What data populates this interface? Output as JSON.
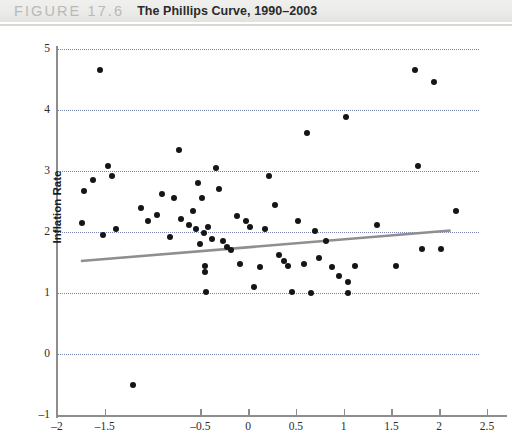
{
  "header": {
    "figure_label": "FIGURE 17.6",
    "figure_title": "The Phillips Curve, 1990–2003"
  },
  "chart_data": {
    "type": "scatter",
    "title": "The Phillips Curve, 1990–2003",
    "xlabel": "Percentage Deviation from Trend in GDP",
    "ylabel": "Inflation Rate",
    "xlim": [
      -2,
      2.5
    ],
    "ylim": [
      -1,
      5
    ],
    "grid": true,
    "legend": "none",
    "xticks": [
      -2,
      -1.5,
      -0.5,
      0,
      0.5,
      1,
      1.5,
      2,
      2.5
    ],
    "xtick_labels": [
      "–2",
      "–1.5",
      "–0.5",
      "0",
      "0.5",
      "1",
      "1.5",
      "2",
      "2.5"
    ],
    "yticks": [
      -1,
      0,
      1,
      2,
      3,
      4,
      5
    ],
    "ytick_labels": [
      "–1",
      "0",
      "1",
      "2",
      "3",
      "4",
      "5"
    ],
    "gridlines_y": [
      0,
      1,
      2,
      3,
      4,
      5
    ],
    "points": [
      [
        -1.74,
        2.15
      ],
      [
        -1.72,
        2.68
      ],
      [
        -1.62,
        2.86
      ],
      [
        -1.55,
        4.65
      ],
      [
        -1.52,
        1.95
      ],
      [
        -1.47,
        3.08
      ],
      [
        -1.42,
        2.92
      ],
      [
        -1.38,
        2.05
      ],
      [
        -1.2,
        -0.5
      ],
      [
        -1.12,
        2.4
      ],
      [
        -1.05,
        2.18
      ],
      [
        -0.95,
        2.28
      ],
      [
        -0.9,
        2.62
      ],
      [
        -0.82,
        1.92
      ],
      [
        -0.78,
        2.55
      ],
      [
        -0.72,
        3.35
      ],
      [
        -0.7,
        2.22
      ],
      [
        -0.62,
        2.12
      ],
      [
        -0.58,
        2.35
      ],
      [
        -0.55,
        2.05
      ],
      [
        -0.52,
        2.8
      ],
      [
        -0.5,
        1.8
      ],
      [
        -0.48,
        2.55
      ],
      [
        -0.46,
        1.98
      ],
      [
        -0.45,
        1.45
      ],
      [
        -0.45,
        1.35
      ],
      [
        -0.44,
        1.02
      ],
      [
        -0.42,
        2.08
      ],
      [
        -0.38,
        1.88
      ],
      [
        -0.34,
        3.05
      ],
      [
        -0.3,
        2.7
      ],
      [
        -0.26,
        1.85
      ],
      [
        -0.22,
        1.75
      ],
      [
        -0.18,
        1.7
      ],
      [
        -0.12,
        2.26
      ],
      [
        -0.08,
        1.48
      ],
      [
        -0.02,
        2.18
      ],
      [
        0.02,
        2.08
      ],
      [
        0.06,
        1.1
      ],
      [
        0.12,
        1.42
      ],
      [
        0.18,
        2.05
      ],
      [
        0.22,
        2.92
      ],
      [
        0.28,
        2.45
      ],
      [
        0.32,
        1.62
      ],
      [
        0.38,
        1.52
      ],
      [
        0.42,
        1.45
      ],
      [
        0.46,
        1.02
      ],
      [
        0.52,
        2.18
      ],
      [
        0.58,
        1.48
      ],
      [
        0.62,
        3.62
      ],
      [
        0.66,
        1.0
      ],
      [
        0.7,
        2.02
      ],
      [
        0.74,
        1.58
      ],
      [
        0.82,
        1.85
      ],
      [
        0.88,
        1.42
      ],
      [
        0.95,
        1.28
      ],
      [
        1.02,
        3.88
      ],
      [
        1.05,
        1.18
      ],
      [
        1.05,
        1.0
      ],
      [
        1.12,
        1.45
      ],
      [
        1.35,
        2.12
      ],
      [
        1.55,
        1.45
      ],
      [
        1.75,
        4.65
      ],
      [
        1.78,
        3.08
      ],
      [
        1.82,
        1.72
      ],
      [
        1.95,
        4.46
      ],
      [
        2.02,
        1.72
      ],
      [
        2.18,
        2.35
      ]
    ],
    "trend_line": {
      "type": "linear-fit",
      "x_start": -1.75,
      "y_start": 1.95,
      "x_end": 2.12,
      "y_end": 2.45,
      "color": "#8f8f8f"
    },
    "colors": {
      "point": "#151515",
      "grid": "#6f7fa8",
      "axis": "#8d8d8d",
      "trend": "#8f8f8f"
    }
  }
}
